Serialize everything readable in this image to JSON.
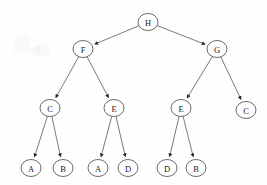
{
  "diagram": {
    "type": "directed-tree",
    "background_color": "#fefefe",
    "node_stroke_color": "#5a5a5a",
    "edge_color": "#6b6b6b",
    "label_color": "#1a1a1a",
    "node_shape": "ellipse",
    "node_rx": 10,
    "node_ry": 8.5,
    "arrowheads": "true",
    "nodes": [
      {
        "id": "n0",
        "label": "H",
        "x": 148,
        "y": 22,
        "level": 0,
        "role": "root"
      },
      {
        "id": "n1",
        "label": "F",
        "x": 83,
        "y": 49,
        "level": 1,
        "role": "internal"
      },
      {
        "id": "n2",
        "label": "G",
        "x": 217,
        "y": 49,
        "level": 1,
        "role": "internal"
      },
      {
        "id": "n3",
        "label": "C",
        "x": 50,
        "y": 108,
        "level": 2,
        "role": "internal"
      },
      {
        "id": "n4",
        "label": "E",
        "x": 114,
        "y": 108,
        "level": 2,
        "role": "internal"
      },
      {
        "id": "n5",
        "label": "E",
        "x": 181,
        "y": 108,
        "level": 2,
        "role": "internal"
      },
      {
        "id": "n6",
        "label": "C",
        "x": 246,
        "y": 110,
        "level": 2,
        "role": "leaf"
      },
      {
        "id": "n7",
        "label": "A",
        "x": 31,
        "y": 168,
        "level": 3,
        "role": "leaf"
      },
      {
        "id": "n8",
        "label": "B",
        "x": 63,
        "y": 168,
        "level": 3,
        "role": "leaf"
      },
      {
        "id": "n9",
        "label": "A",
        "x": 98,
        "y": 168,
        "level": 3,
        "role": "leaf"
      },
      {
        "id": "n10",
        "label": "D",
        "x": 128,
        "y": 168,
        "level": 3,
        "role": "leaf"
      },
      {
        "id": "n11",
        "label": "D",
        "x": 167,
        "y": 168,
        "level": 3,
        "role": "leaf"
      },
      {
        "id": "n12",
        "label": "B",
        "x": 196,
        "y": 168,
        "level": 3,
        "role": "leaf"
      }
    ],
    "edges": [
      {
        "from": "n0",
        "to": "n1",
        "label": "H-F"
      },
      {
        "from": "n0",
        "to": "n2",
        "label": "H-G"
      },
      {
        "from": "n1",
        "to": "n3",
        "label": "F-C"
      },
      {
        "from": "n1",
        "to": "n4",
        "label": "F-E"
      },
      {
        "from": "n2",
        "to": "n5",
        "label": "G-E"
      },
      {
        "from": "n2",
        "to": "n6",
        "label": "G-C"
      },
      {
        "from": "n3",
        "to": "n7",
        "label": "C-A"
      },
      {
        "from": "n3",
        "to": "n8",
        "label": "C-B"
      },
      {
        "from": "n4",
        "to": "n9",
        "label": "E-A"
      },
      {
        "from": "n4",
        "to": "n10",
        "label": "E-D"
      },
      {
        "from": "n5",
        "to": "n11",
        "label": "E-D"
      },
      {
        "from": "n5",
        "to": "n12",
        "label": "E-B"
      }
    ]
  }
}
